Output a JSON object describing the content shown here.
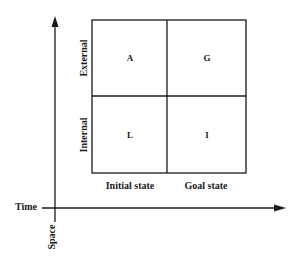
{
  "diagram": {
    "axes": {
      "horizontal_label": "Time",
      "vertical_label": "Space"
    },
    "rows": [
      {
        "label": "External"
      },
      {
        "label": "Internal"
      }
    ],
    "columns": [
      {
        "label": "Initial state"
      },
      {
        "label": "Goal state"
      }
    ],
    "cells": [
      [
        "A",
        "G"
      ],
      [
        "L",
        "I"
      ]
    ],
    "colors": {
      "line": "#1a1a1a",
      "background": "#ffffff"
    }
  }
}
